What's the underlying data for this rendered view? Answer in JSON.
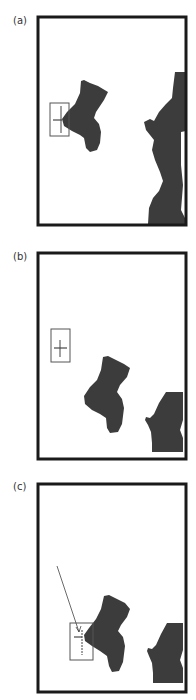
{
  "figure": {
    "panels": [
      {
        "label": "(a)",
        "label_pos": [
          13,
          27
        ],
        "frame": {
          "x": 38,
          "y": 17,
          "w": 148,
          "h": 208
        },
        "crosshair_box": {
          "x": 50,
          "y": 103,
          "w": 19,
          "h": 33
        },
        "crosshair": {
          "cx": 61,
          "cy": 120,
          "hx1": 53,
          "hx2": 62,
          "vy1": 106,
          "vy2": 133
        },
        "stocking_path": "M81,81 L84,80 L90,83 L98,86 L108,92 L104,100 L96,112 L94,118 L99,124 L101,132 L100,143 L97,150 L90,152 L86,148 L84,138 L80,135 L72,131 L64,126 L62,119 L67,112 L75,104 L80,93 Z",
        "figure_path": "M175,72 L186,72 L186,131 L181,132 L181,165 L183,185 L181,210 L186,220 L186,224 L148,224 L149,208 L153,198 L159,191 L163,181 L160,172 L155,160 L152,150 L154,140 L150,135 L146,130 L144,122 L150,119 L154,121 L159,112 L166,104 L172,98 L173,88 Z"
      },
      {
        "label": "(b)",
        "label_pos": [
          13,
          262
        ],
        "frame": {
          "x": 38,
          "y": 253,
          "w": 148,
          "h": 206
        },
        "crosshair_box": {
          "x": 51,
          "y": 329,
          "w": 19,
          "h": 33
        },
        "crosshair": {
          "cx": 60,
          "cy": 348,
          "hx1": 54,
          "hx2": 67,
          "vy1": 340,
          "vy2": 357
        },
        "stocking_path": "M103,357 L108,356 L116,360 L124,364 L130,368 L127,377 L120,385 L117,392 L122,399 L124,408 L122,424 L118,432 L110,433 L107,428 L106,418 L100,414 L92,410 L85,404 L84,396 L90,387 L97,380 L101,370 Z",
        "figure_path": "M166,392 L183,392 L183,420 L180,430 L183,438 L183,452 L152,452 L152,443 L151,432 L148,425 L145,420 L146,417 L150,418 L154,414 L159,403 Z"
      },
      {
        "label": "(c)",
        "label_pos": [
          13,
          492
        ],
        "frame": {
          "x": 38,
          "y": 484,
          "w": 148,
          "h": 208
        },
        "crosshair_box": {
          "x": 70,
          "y": 623,
          "w": 23,
          "h": 37
        },
        "crosshair": {
          "cx": 82,
          "cy": 637,
          "hx1": 74,
          "hx2": 82,
          "vy1": 630,
          "vy2": 655
        },
        "arrow": {
          "x1": 57,
          "y1": 566,
          "x2": 79,
          "y2": 632
        },
        "stocking_path": "M104,596 L109,595 L117,599 L125,603 L130,609 L127,617 L121,625 L118,631 L123,637 L125,646 L123,662 L119,671 L112,672 L109,666 L107,656 L100,651 L92,646 L85,641 L84,635 L89,628 L96,619 L101,609 Z",
        "figure_path": "M167,623 L183,623 L183,650 L180,660 L183,668 L183,683 L153,683 L153,673 L152,663 L149,656 L147,651 L148,648 L152,649 L156,645 L161,634 Z"
      }
    ],
    "colors": {
      "frame": "#1a1a1a",
      "silhouette": "#3c3c3c",
      "box_stroke": "#555555",
      "label": "#333333"
    }
  }
}
